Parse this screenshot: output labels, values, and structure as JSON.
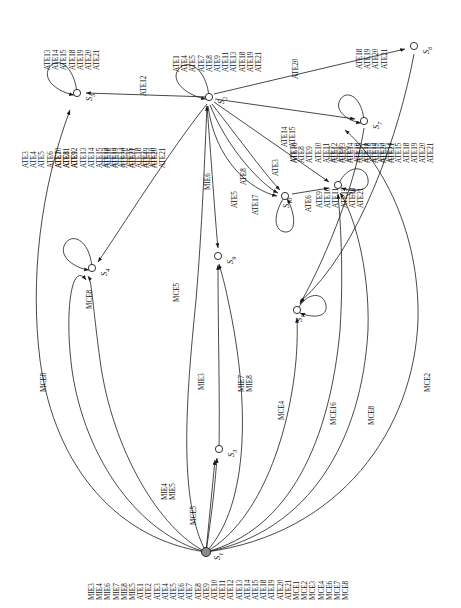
{
  "figure": {
    "type": "state-transition-diagram",
    "orientation": "rotated-90-ccw",
    "background": "#ffffff",
    "stroke_color": "#1a1a1a",
    "initial_state_fill": "#8a8a8a"
  },
  "states": [
    {
      "id": "S1",
      "label": "S",
      "sub": "1",
      "kind": "initial-filled",
      "x": 206,
      "y": 552
    },
    {
      "id": "S2",
      "label": "S",
      "sub": "2",
      "kind": "open",
      "x": 209,
      "y": 97
    },
    {
      "id": "S3",
      "label": "S",
      "sub": "3",
      "kind": "open",
      "x": 219,
      "y": 449
    },
    {
      "id": "S4",
      "label": "S",
      "sub": "4",
      "kind": "open",
      "x": 92,
      "y": 268
    },
    {
      "id": "S5",
      "label": "S",
      "sub": "5",
      "kind": "open",
      "x": 77,
      "y": 93
    },
    {
      "id": "S6",
      "label": "S",
      "sub": "6",
      "kind": "open",
      "x": 414,
      "y": 46
    },
    {
      "id": "S7",
      "label": "S",
      "sub": "7",
      "kind": "open",
      "x": 364,
      "y": 121
    },
    {
      "id": "S8",
      "label": "S",
      "sub": "8",
      "kind": "open",
      "x": 338,
      "y": 185
    },
    {
      "id": "S9",
      "label": "S",
      "sub": "9",
      "kind": "open",
      "x": 218,
      "y": 256
    },
    {
      "id": "S10",
      "label": "S",
      "sub": "10",
      "kind": "open",
      "x": 285,
      "y": 196
    },
    {
      "id": "S11",
      "label": "S",
      "sub": "11",
      "kind": "open",
      "x": 297,
      "y": 310
    }
  ],
  "self_loops": [
    {
      "state": "S2",
      "labels": [
        "ATE1",
        "ATE4",
        "ATE5",
        "ATE7",
        "ATE8",
        "ATE9",
        "ATE11",
        "ATE13",
        "ATE18",
        "ATE19",
        "ATE21"
      ]
    },
    {
      "state": "S5",
      "labels": [
        "ATE13",
        "ATE14",
        "ATE15",
        "ATE18",
        "ATE19",
        "ATE20",
        "ATE21"
      ]
    },
    {
      "state": "S4",
      "labels": [
        "ATE10",
        "ATE11",
        "ATE12",
        "ATE13",
        "ATE14",
        "ATE15",
        "ATE18",
        "ATE19",
        "ATE20",
        "ATE21"
      ]
    },
    {
      "state": "S7",
      "labels": [
        "ATE18",
        "ATE19",
        "ATE20",
        "ATE21"
      ]
    },
    {
      "state": "S8",
      "labels": [
        "ATE7",
        "ATE8",
        "ATE9",
        "ATE10",
        "ATE11",
        "ATE12",
        "ATE13",
        "ATE14",
        "ATE15",
        "ATE18",
        "ATE19",
        "ATE20",
        "ATE21"
      ]
    },
    {
      "state": "S10",
      "labels": [
        "ATE17"
      ]
    },
    {
      "state": "S11",
      "labels": [
        "ATE9",
        "ATE10",
        "ATE11",
        "ATE13",
        "ATE18",
        "ATE21"
      ]
    }
  ],
  "edges": [
    {
      "from": "S2",
      "to": "S5",
      "labels": [
        "ATE12"
      ]
    },
    {
      "from": "S2",
      "to": "S4",
      "labels": [
        "ATE2",
        "ATE10"
      ]
    },
    {
      "from": "S2",
      "to": "S6",
      "labels": [
        "ATE20"
      ]
    },
    {
      "from": "S2",
      "to": "S7",
      "labels": [
        "ATE14",
        "ATE15"
      ]
    },
    {
      "from": "S2",
      "to": "S8",
      "labels": [
        "ATE16"
      ]
    },
    {
      "from": "S2",
      "to": "S10",
      "labels": [
        "ATE3"
      ]
    },
    {
      "from": "S2",
      "to": "S10",
      "labels": [
        "ATE8"
      ]
    },
    {
      "from": "S2",
      "to": "S10",
      "labels": [
        "ATE5"
      ]
    },
    {
      "from": "S10",
      "to": "S8",
      "labels": [
        "ATE6"
      ]
    },
    {
      "from": "S2",
      "to": "S9",
      "labels": [
        "MIE6"
      ]
    },
    {
      "from": "S1",
      "to": "S2",
      "labels": [
        "MCE5"
      ]
    },
    {
      "from": "S1",
      "to": "S9",
      "labels": [
        "MIE3"
      ]
    },
    {
      "from": "S1",
      "to": "S9",
      "labels": [
        "MIE7",
        "MIE8"
      ]
    },
    {
      "from": "S1",
      "to": "S11",
      "labels": [
        "MCE4"
      ]
    },
    {
      "from": "S1",
      "to": "S3",
      "labels": [
        "MIE4",
        "MIE5"
      ]
    },
    {
      "from": "S1",
      "to": "S3",
      "labels": [
        "MCE5"
      ]
    },
    {
      "from": "S1",
      "to": "S4",
      "labels": [
        "MCE8"
      ]
    },
    {
      "from": "S1",
      "to": "S4",
      "labels": [
        "MCE8"
      ]
    },
    {
      "from": "S1",
      "to": "S8",
      "labels": [
        "MCE2"
      ]
    },
    {
      "from": "S1",
      "to": "S8",
      "labels": [
        "MCE8"
      ]
    },
    {
      "from": "S1",
      "to": "S8",
      "labels": [
        "MCE16"
      ]
    },
    {
      "from": "S5",
      "to": "S1",
      "labels": [
        "ATE3",
        "ATE4",
        "ATE5",
        "ATE6",
        "ATE7",
        "ATE8",
        "ATE9"
      ]
    },
    {
      "from": "S4",
      "to": "S1",
      "labels": [
        "ATE10",
        "ATE11",
        "ATE12",
        "ATE13",
        "ATE14",
        "ATE15",
        "ATE18",
        "ATE19",
        "ATE20",
        "ATE21"
      ]
    },
    {
      "from": "S2",
      "to": "S1",
      "labels": [
        "ATE12",
        "ATE13",
        "ATE14",
        "ATE15",
        "ATE18",
        "ATE19",
        "ATE20",
        "ATE21"
      ]
    }
  ],
  "edge_label_groups": [
    {
      "id": "g-s5-loop",
      "labels": [
        "ATE13",
        "ATE14",
        "ATE15",
        "ATE18",
        "ATE19",
        "ATE20",
        "ATE21"
      ]
    },
    {
      "id": "g-s2-loop",
      "labels": [
        "ATE1",
        "ATE4",
        "ATE5",
        "ATE7",
        "ATE8",
        "ATE9",
        "ATE11",
        "ATE13",
        "ATE18",
        "ATE19",
        "ATE21"
      ]
    },
    {
      "id": "g-ate12",
      "labels": [
        "ATE12"
      ]
    },
    {
      "id": "g-ate2-10",
      "labels": [
        "ATE2",
        "ATE10"
      ]
    },
    {
      "id": "g-ate20",
      "labels": [
        "ATE20"
      ]
    },
    {
      "id": "g-ate14-15",
      "labels": [
        "ATE14",
        "ATE15"
      ]
    },
    {
      "id": "g-s7-loop",
      "labels": [
        "ATE18",
        "ATE19",
        "ATE20",
        "ATE21"
      ]
    },
    {
      "id": "g-ate16",
      "labels": [
        "ATE16"
      ]
    },
    {
      "id": "g-s8-loop",
      "labels": [
        "ATE7",
        "ATE8",
        "ATE9",
        "ATE10",
        "ATE11",
        "ATE12",
        "ATE13",
        "ATE14",
        "ATE15",
        "ATE18",
        "ATE19",
        "ATE20",
        "ATE21"
      ]
    },
    {
      "id": "g-ate3",
      "labels": [
        "ATE3"
      ]
    },
    {
      "id": "g-ate8",
      "labels": [
        "ATE8"
      ]
    },
    {
      "id": "g-ate5",
      "labels": [
        "ATE5"
      ]
    },
    {
      "id": "g-ate6",
      "labels": [
        "ATE6"
      ]
    },
    {
      "id": "g-ate17",
      "labels": [
        "ATE17"
      ]
    },
    {
      "id": "g-mie6",
      "labels": [
        "MIE6"
      ]
    },
    {
      "id": "g-mce5-top",
      "labels": [
        "MCE5"
      ]
    },
    {
      "id": "g-mie3",
      "labels": [
        "MIE3"
      ]
    },
    {
      "id": "g-mie7-8",
      "labels": [
        "MIE7",
        "MIE8"
      ]
    },
    {
      "id": "g-mce4",
      "labels": [
        "MCE4"
      ]
    },
    {
      "id": "g-mie4-5",
      "labels": [
        "MIE4",
        "MIE5"
      ]
    },
    {
      "id": "g-mce5-bot",
      "labels": [
        "MCE5"
      ]
    },
    {
      "id": "g-mce8-left",
      "labels": [
        "MCE8"
      ]
    },
    {
      "id": "g-mce8-mid",
      "labels": [
        "MCE8"
      ]
    },
    {
      "id": "g-mce2",
      "labels": [
        "MCE2"
      ]
    },
    {
      "id": "g-mce8-right",
      "labels": [
        "MCE8"
      ]
    },
    {
      "id": "g-mce16",
      "labels": [
        "MCE16"
      ]
    },
    {
      "id": "g-s11-loop",
      "labels": [
        "ATE9",
        "ATE10",
        "ATE11",
        "ATE13",
        "ATE18",
        "ATE21"
      ]
    },
    {
      "id": "g-left-col-a",
      "labels": [
        "ATE3",
        "ATE4",
        "ATE5",
        "ATE6",
        "ATE7",
        "ATE8",
        "ATE9"
      ]
    },
    {
      "id": "g-left-col-b",
      "labels": [
        "ATE10",
        "ATE11",
        "ATE12",
        "ATE13",
        "ATE14",
        "ATE15",
        "ATE18",
        "ATE19",
        "ATE20",
        "ATE21"
      ]
    },
    {
      "id": "g-left-col-c",
      "labels": [
        "ATE12",
        "ATE13",
        "ATE14",
        "ATE15",
        "ATE18",
        "ATE19",
        "ATE20",
        "ATE21"
      ]
    },
    {
      "id": "g-s8-in-left",
      "labels": [
        "ATE7",
        "ATE8",
        "ATE9",
        "ATE10",
        "ATE11",
        "ATE12",
        "ATE13",
        "ATE14",
        "ATE15",
        "ATE18",
        "ATE19",
        "ATE20",
        "ATE21"
      ]
    },
    {
      "id": "g-bottom-all",
      "labels": [
        "MIE3",
        "MIE4",
        "MIE6",
        "MIE7",
        "MIE8",
        "MIE5",
        "ATE1",
        "ATE2",
        "ATE3",
        "ATE4",
        "ATE5",
        "ATE6",
        "ATE7",
        "ATE8",
        "ATE9",
        "ATE10",
        "ATE11",
        "ATE12",
        "ATE13",
        "ATE14",
        "ATE15",
        "ATE18",
        "ATE19",
        "ATE20",
        "ATE21",
        "MCE1",
        "MCE2",
        "MCE3",
        "MCE4",
        "MCE6",
        "MCE7",
        "MCE8"
      ]
    }
  ]
}
